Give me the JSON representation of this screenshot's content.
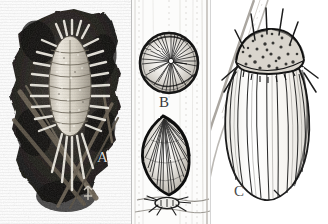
{
  "plate": {
    "title": "Scale insect and mealybug specimen plate",
    "background_color": "#ffffff",
    "ink_color": "#1a1a1a",
    "width": 328,
    "height": 224,
    "panel_count": 3
  },
  "labels": {
    "a": "A",
    "b": "B",
    "c": "C"
  },
  "panels": [
    {
      "id": "a",
      "label": "A",
      "style": "halftone-photograph",
      "subject": "mealybug on dark leaf with waxy marginal filaments",
      "background_color": "#141414",
      "specimen_color": "#e8e4dc",
      "x": 0,
      "width": 131
    },
    {
      "id": "b",
      "label": "B",
      "style": "line-drawing",
      "subject": "armoured scale covers on plant stem with crawler",
      "background_color": "#fbfbfb",
      "specimen_color": "#202020",
      "x": 131,
      "width": 79
    },
    {
      "id": "c",
      "label": "C",
      "style": "line-drawing",
      "subject": "ribbed ovoid scale insect with bristled prothorax",
      "background_color": "#ffffff",
      "specimen_color": "#2b2b2b",
      "x": 210,
      "width": 118
    }
  ]
}
